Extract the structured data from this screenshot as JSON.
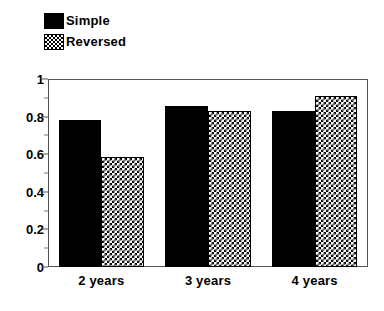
{
  "chart_data": {
    "type": "bar",
    "title": "",
    "subtitle": "",
    "xlabel": "",
    "ylabel": "",
    "categories": [
      "2 years",
      "3 years",
      "4 years"
    ],
    "series": [
      {
        "name": "Simple",
        "values": [
          0.78,
          0.855,
          0.83
        ],
        "fill": "solid-black",
        "color": "#000000"
      },
      {
        "name": "Reversed",
        "values": [
          0.585,
          0.83,
          0.91
        ],
        "fill": "checkerboard",
        "color": "#000000"
      }
    ],
    "ylim": [
      0,
      1
    ],
    "y_ticks": [
      0,
      0.2,
      0.4,
      0.6,
      0.8,
      1
    ],
    "y_tick_labels": [
      "0",
      "0.2",
      "0.4",
      "0.6",
      "0.8",
      "1"
    ],
    "y_minor_ticks": [
      0.1,
      0.3,
      0.5,
      0.7,
      0.9
    ],
    "grid": false,
    "legend_position": "top-left",
    "frame": true,
    "annotations": []
  },
  "legend": {
    "items": [
      {
        "label": "Simple",
        "swatch": "solid-swatch-icon"
      },
      {
        "label": "Reversed",
        "swatch": "checker-swatch-icon"
      }
    ]
  },
  "axes": {
    "y_labels": [
      "1",
      "0.8",
      "0.6",
      "0.4",
      "0.2",
      "0"
    ],
    "x_labels": [
      "2 years",
      "3 years",
      "4 years"
    ]
  }
}
